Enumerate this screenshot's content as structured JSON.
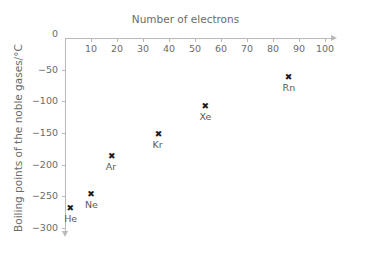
{
  "ghost": {
    "top_text": "  ",
    "left_text": " "
  },
  "chart_data": {
    "type": "scatter",
    "title": "",
    "xlabel": "Number of electrons",
    "ylabel": "Boiling points of the noble gases/°C",
    "xlim": [
      0,
      100
    ],
    "ylim": [
      -300,
      0
    ],
    "grid": false,
    "legend": "none",
    "marker": "x",
    "marker_color": "#1b1b1b",
    "axis_color": "#b9b9b9",
    "text_color": "#6b6b6b",
    "xticks": [
      0,
      10,
      20,
      30,
      40,
      50,
      60,
      70,
      80,
      90,
      100
    ],
    "xtick_labels": [
      "0",
      "10",
      "20",
      "30",
      "40",
      "50",
      "60",
      "70",
      "80",
      "90",
      "100"
    ],
    "yticks": [
      0,
      -50,
      -100,
      -150,
      -200,
      -250,
      -300
    ],
    "ytick_labels": [
      "0",
      "−50",
      "−100",
      "−150",
      "−200",
      "−250",
      "−300"
    ],
    "marker_glyph": "✖",
    "points": [
      {
        "label": "He",
        "x": 2,
        "y": -269
      },
      {
        "label": "Ne",
        "x": 10,
        "y": -246
      },
      {
        "label": "Ar",
        "x": 18,
        "y": -186
      },
      {
        "label": "Kr",
        "x": 36,
        "y": -152
      },
      {
        "label": "Xe",
        "x": 54,
        "y": -108
      },
      {
        "label": "Rn",
        "x": 86,
        "y": -62
      }
    ]
  }
}
